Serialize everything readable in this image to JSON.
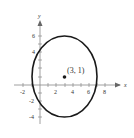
{
  "diagram": {
    "type": "ellipse-plot",
    "axis_x_label": "x",
    "axis_y_label": "y",
    "x_ticks": [
      "-2",
      "2",
      "4",
      "6",
      "8"
    ],
    "y_ticks": [
      "6",
      "4",
      "-2",
      "-4"
    ],
    "center_label": "(3, 1)",
    "center": [
      3,
      1
    ],
    "x_range": [
      -1,
      7
    ],
    "y_range": [
      -4,
      6
    ],
    "colors": {
      "curve": "#1a1a1a",
      "axis": "#888888"
    }
  }
}
